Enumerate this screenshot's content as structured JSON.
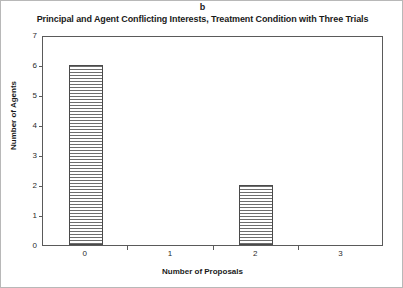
{
  "figure": {
    "panel_label": "b",
    "title": "Principal and Agent Conflicting Interests, Treatment Condition with Three Trials"
  },
  "chart_data": {
    "type": "bar",
    "title": "Principal and Agent Conflicting Interests, Treatment Condition with Three Trials",
    "panel": "b",
    "categories": [
      "0",
      "1",
      "2",
      "3"
    ],
    "values": [
      6,
      0,
      2,
      0
    ],
    "series": [
      {
        "name": "Number of Agents",
        "values": [
          6,
          0,
          2,
          0
        ]
      }
    ],
    "xlabel": "Number of Proposals",
    "ylabel": "Number of Agents",
    "ylim": [
      0,
      7
    ],
    "yticks": [
      0,
      1,
      2,
      3,
      4,
      5,
      6,
      7
    ],
    "ytick_labels": [
      "0",
      "1",
      "2",
      "3",
      "4",
      "5",
      "6",
      "7"
    ],
    "xtick_labels": [
      "0",
      "1",
      "2",
      "3"
    ],
    "grid": false,
    "legend": false,
    "bar_fill": "horizontal-hatch",
    "bar_edge_color": "#4a4a4a",
    "frame_color": "#5a5a5a",
    "background": "#ffffff"
  }
}
